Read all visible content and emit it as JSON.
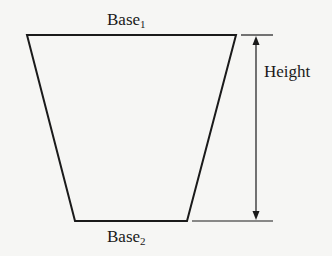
{
  "diagram": {
    "type": "trapezoid-dimension-figure",
    "labels": {
      "top_base": "Base",
      "top_base_sub": "1",
      "bottom_base": "Base",
      "bottom_base_sub": "2",
      "height": "Height"
    },
    "colors": {
      "line": "#1a1a1a",
      "background": "#f6f6f4"
    }
  }
}
